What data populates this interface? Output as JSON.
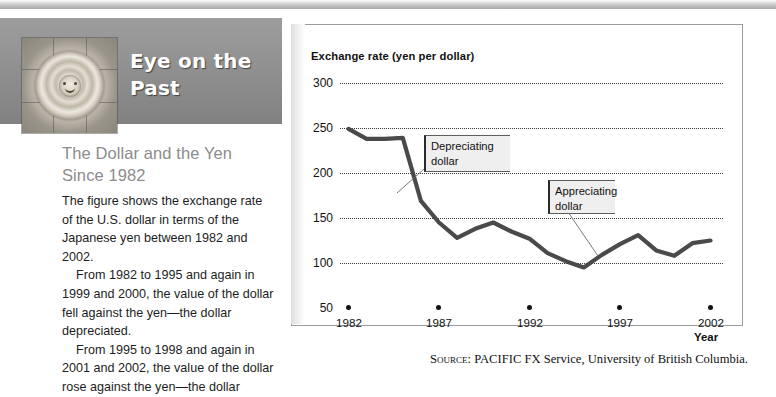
{
  "feature": {
    "title": "Eye on the\nPast",
    "subtitle": "The Dollar and the Yen\nSince 1982",
    "paragraphs": [
      "The figure shows the exchange rate of the U.S. dollar in terms of the Japanese yen between 1982 and 2002.",
      "From 1982 to 1995 and again in 1999 and 2000, the value of the dollar fell against the yen—the dollar depreciated.",
      "From 1995 to 1998 and again in 2001 and 2002, the value of the dollar rose against the yen—the dollar"
    ],
    "icon_name": "aztec-sun-stone"
  },
  "source": {
    "prefix": "Source:",
    "text": "PACIFIC FX Service, University of British Columbia."
  },
  "callouts": {
    "depreciating": "Depreciating\ndollar",
    "appreciating": "Appreciating\ndollar"
  },
  "chart_data": {
    "type": "line",
    "title": "Exchange rate (yen per dollar)",
    "xlabel": "Year",
    "ylabel": "Exchange rate (yen per dollar)",
    "xlim": [
      1982,
      2002
    ],
    "ylim": [
      50,
      300
    ],
    "yticks": [
      50,
      100,
      150,
      200,
      250,
      300
    ],
    "xticks": [
      1982,
      1987,
      1992,
      1997,
      2002
    ],
    "ytick_labels": [
      "50",
      "100",
      "150",
      "200",
      "250",
      "300"
    ],
    "xtick_labels": [
      "1982",
      "1987",
      "1992",
      "1997",
      "2002"
    ],
    "grid": "horizontal-dotted",
    "legend": "none",
    "line_color": "#4a4a4a",
    "series": [
      {
        "name": "Yen per U.S. dollar",
        "x": [
          1982,
          1983,
          1984,
          1985,
          1986,
          1987,
          1988,
          1989,
          1990,
          1991,
          1992,
          1993,
          1994,
          1995,
          1996,
          1997,
          1998,
          1999,
          2000,
          2001,
          2002
        ],
        "values": [
          249,
          238,
          238,
          239,
          169,
          145,
          128,
          138,
          145,
          135,
          127,
          111,
          102,
          95,
          109,
          121,
          131,
          114,
          108,
          122,
          125
        ]
      }
    ],
    "annotations": [
      {
        "label": "Depreciating dollar",
        "points_to_year": 1986,
        "points_to_value": 193
      },
      {
        "label": "Appreciating dollar",
        "points_to_year": 1996,
        "points_to_value": 109
      }
    ]
  }
}
